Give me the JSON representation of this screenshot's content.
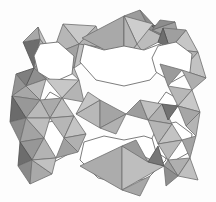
{
  "figure": {
    "kind": "crystal-structure-polyhedral-framework",
    "title": "",
    "caption": "",
    "background_color": "#fdfdfd",
    "width": 216,
    "height": 202
  },
  "palette": {
    "background": "#fdfdfd",
    "pore_white": "#ffffff",
    "face_lightest": "#d8d8d8",
    "face_light": "#c8c8c8",
    "face_mid_light": "#b9b9b9",
    "face_mid": "#ababab",
    "face_mid_dark": "#9a9a9a",
    "face_dark": "#8a8a8a",
    "face_darker": "#7a7a7a",
    "face_darkest": "#636363",
    "edge_stroke": "#6e6e6e",
    "edge_stroke_dark": "#4f4f4f"
  },
  "structure": {
    "description": "Corner-sharing tetrahedra framework projected down a channel axis",
    "motifs": [
      {
        "name": "large-pore-8-ring",
        "count": 2,
        "fill": "#ffffff"
      },
      {
        "name": "small-pore-star-ring",
        "count": 4,
        "fill": "#ffffff"
      },
      {
        "name": "bowtie-tetrahedra-pair",
        "count": 5
      },
      {
        "name": "square-4-ring-window",
        "count": 2,
        "fill": "#ffffff"
      }
    ],
    "symmetry": "2-fold / mirror about vertical and horizontal center"
  },
  "polygons": [
    {
      "id": "p001",
      "name": "tet-face",
      "points": "63,24 79,44 52,55",
      "fill": "#b6b6b6",
      "stroke": "#6e6e6e"
    },
    {
      "id": "p002",
      "name": "tet-face",
      "points": "63,24 79,44 96,26",
      "fill": "#c9c9c9",
      "stroke": "#6e6e6e"
    },
    {
      "id": "p003",
      "name": "tet-face",
      "points": "52,55 79,44 74,68",
      "fill": "#a2a2a2",
      "stroke": "#6e6e6e"
    },
    {
      "id": "p004",
      "name": "tet-face-dark",
      "points": "23,42 40,39 34,68",
      "fill": "#6d6d6d",
      "stroke": "#4f4f4f"
    },
    {
      "id": "p005",
      "name": "tet-face",
      "points": "23,42 40,39 38,27",
      "fill": "#a8a8a8",
      "stroke": "#6e6e6e"
    },
    {
      "id": "p006",
      "name": "tet-face",
      "points": "40,39 34,68 52,55",
      "fill": "#b0b0b0",
      "stroke": "#6e6e6e"
    },
    {
      "id": "p007",
      "name": "tet-face",
      "points": "38,27 40,39 52,55",
      "fill": "#c4c4c4",
      "stroke": "#6e6e6e"
    },
    {
      "id": "p008",
      "name": "tet-face",
      "points": "34,68 52,55 46,79",
      "fill": "#9e9e9e",
      "stroke": "#6e6e6e"
    },
    {
      "id": "p009",
      "name": "tet-face",
      "points": "46,79 34,68 26,86",
      "fill": "#8f8f8f",
      "stroke": "#6e6e6e"
    },
    {
      "id": "p010",
      "name": "tet-face",
      "points": "74,68 52,55 79,80",
      "fill": "#bdbdbd",
      "stroke": "#6e6e6e"
    },
    {
      "id": "p011",
      "name": "tet-face",
      "points": "96,26 79,44 104,48",
      "fill": "#b3b3b3",
      "stroke": "#6e6e6e"
    },
    {
      "id": "p012",
      "name": "tet-face",
      "points": "79,44 104,48 74,68",
      "fill": "#c1c1c1",
      "stroke": "#6e6e6e"
    },
    {
      "id": "p013",
      "name": "bowtie-left",
      "points": "82,38 124,16 124,60",
      "fill": "#a9a9a9",
      "stroke": "#6e6e6e"
    },
    {
      "id": "p014",
      "name": "bowtie-right",
      "points": "166,38 124,16 124,60",
      "fill": "#bcbcbc",
      "stroke": "#6e6e6e"
    },
    {
      "id": "p015",
      "name": "bowtie-wing",
      "points": "124,16 140,10 150,30",
      "fill": "#9c9c9c",
      "stroke": "#6e6e6e"
    },
    {
      "id": "p016",
      "name": "tet-face",
      "points": "150,30 166,38 140,10",
      "fill": "#8b8b8b",
      "stroke": "#6e6e6e"
    },
    {
      "id": "p017",
      "name": "tet-face",
      "points": "152,26 166,38 175,22",
      "fill": "#7b7b7b",
      "stroke": "#4f4f4f"
    },
    {
      "id": "p018",
      "name": "tet-face",
      "points": "137,44 124,60 150,62",
      "fill": "#bfbfbf",
      "stroke": "#6e6e6e"
    },
    {
      "id": "p019",
      "name": "tet-face",
      "points": "153,24 137,44 124,16",
      "fill": "#cdcdcd",
      "stroke": "#6e6e6e"
    },
    {
      "id": "p020",
      "name": "tet-face",
      "points": "137,44 124,16 124,60",
      "fill": "#b5b5b5",
      "stroke": "#6e6e6e"
    },
    {
      "id": "p021",
      "name": "tet-face",
      "points": "152,30 175,22 180,42",
      "fill": "#a0a0a0",
      "stroke": "#6e6e6e"
    },
    {
      "id": "p022",
      "name": "tet-face",
      "points": "160,20 152,30 175,22",
      "fill": "#8d8d8d",
      "stroke": "#6e6e6e"
    },
    {
      "id": "p023",
      "name": "tet-face",
      "points": "186,30 170,49 198,52",
      "fill": "#c6c6c6",
      "stroke": "#6e6e6e"
    },
    {
      "id": "p024",
      "name": "tet-face",
      "points": "186,30 170,49 163,28",
      "fill": "#9f9f9f",
      "stroke": "#6e6e6e"
    },
    {
      "id": "p025",
      "name": "tet-face-dark",
      "points": "158,42 170,49 163,28",
      "fill": "#6f6f6f",
      "stroke": "#4f4f4f"
    },
    {
      "id": "p026",
      "name": "tet-face",
      "points": "170,49 198,52 182,70",
      "fill": "#b2b2b2",
      "stroke": "#6e6e6e"
    },
    {
      "id": "p027",
      "name": "tet-face",
      "points": "170,49 182,70 160,64",
      "fill": "#a5a5a5",
      "stroke": "#6e6e6e"
    },
    {
      "id": "p028",
      "name": "tet-face",
      "points": "198,52 182,70 206,78",
      "fill": "#c2c2c2",
      "stroke": "#6e6e6e"
    },
    {
      "id": "p029",
      "name": "tet-face",
      "points": "182,70 206,78 192,90",
      "fill": "#aeaeae",
      "stroke": "#6e6e6e"
    },
    {
      "id": "p030",
      "name": "tet-face",
      "points": "160,64 182,70 168,86",
      "fill": "#9b9b9b",
      "stroke": "#6e6e6e"
    },
    {
      "id": "p031",
      "name": "tet-face",
      "points": "34,68 26,86 16,74",
      "fill": "#7f7f7f",
      "stroke": "#4f4f4f"
    },
    {
      "id": "p032",
      "name": "tet-face",
      "points": "26,86 16,74 12,96",
      "fill": "#949494",
      "stroke": "#6e6e6e"
    },
    {
      "id": "p033",
      "name": "tet-face",
      "points": "26,86 46,79 40,100",
      "fill": "#bababa",
      "stroke": "#6e6e6e"
    },
    {
      "id": "p034",
      "name": "tet-face",
      "points": "26,86 40,100 12,96",
      "fill": "#a7a7a7",
      "stroke": "#6e6e6e"
    },
    {
      "id": "p035",
      "name": "tet-face",
      "points": "46,79 79,80 62,98",
      "fill": "#c7c7c7",
      "stroke": "#6e6e6e"
    },
    {
      "id": "p036",
      "name": "tet-face",
      "points": "79,80 62,98 84,102",
      "fill": "#b4b4b4",
      "stroke": "#6e6e6e"
    },
    {
      "id": "p037",
      "name": "tet-face",
      "points": "40,100 62,98 50,118",
      "fill": "#aaaaaa",
      "stroke": "#6e6e6e"
    },
    {
      "id": "p038",
      "name": "tet-face",
      "points": "62,98 50,118 74,116",
      "fill": "#bebebe",
      "stroke": "#6e6e6e"
    },
    {
      "id": "p039",
      "name": "bowtie2-left",
      "points": "100,100 100,128 76,114",
      "fill": "#b8b8b8",
      "stroke": "#6e6e6e"
    },
    {
      "id": "p040",
      "name": "bowtie2-right",
      "points": "100,100 100,128 126,114",
      "fill": "#a4a4a4",
      "stroke": "#6e6e6e"
    },
    {
      "id": "p041",
      "name": "bowtie2-tail-l",
      "points": "100,100 88,92 76,114",
      "fill": "#c5c5c5",
      "stroke": "#6e6e6e"
    },
    {
      "id": "p042",
      "name": "bowtie2-tail-r",
      "points": "100,128 126,114 116,134",
      "fill": "#b1b1b1",
      "stroke": "#6e6e6e"
    },
    {
      "id": "p043",
      "name": "tet-face",
      "points": "126,114 140,100 148,120",
      "fill": "#9d9d9d",
      "stroke": "#6e6e6e"
    },
    {
      "id": "p044",
      "name": "tet-face",
      "points": "140,100 148,120 162,104",
      "fill": "#c0c0c0",
      "stroke": "#6e6e6e"
    },
    {
      "id": "p045",
      "name": "tet-face",
      "points": "148,120 162,104 172,124",
      "fill": "#abababab",
      "stroke": "#6e6e6e"
    },
    {
      "id": "p046",
      "name": "tet-face",
      "points": "168,86 192,90 178,106",
      "fill": "#b7b7b7",
      "stroke": "#6e6e6e"
    },
    {
      "id": "p047",
      "name": "tet-face",
      "points": "192,90 178,106 200,112",
      "fill": "#c8c8c8",
      "stroke": "#6e6e6e"
    },
    {
      "id": "p048",
      "name": "tet-face",
      "points": "178,106 200,112 186,126",
      "fill": "#a6a6a6",
      "stroke": "#6e6e6e"
    },
    {
      "id": "p049",
      "name": "tet-face-dark",
      "points": "162,104 178,106 168,120",
      "fill": "#727272",
      "stroke": "#4f4f4f"
    },
    {
      "id": "p050",
      "name": "tet-face",
      "points": "40,100 26,118 12,96",
      "fill": "#9898 98",
      "stroke": "#6e6e6e"
    },
    {
      "id": "p051",
      "name": "tet-face",
      "points": "50,118 26,118 40,100",
      "fill": "#b9b9b9",
      "stroke": "#6e6e6e"
    },
    {
      "id": "p052",
      "name": "tet-face-dark",
      "points": "26,118 12,96 10,122",
      "fill": "#6b6b6b",
      "stroke": "#4f4f4f"
    },
    {
      "id": "p053",
      "name": "tet-face",
      "points": "26,118 10,122 20,142",
      "fill": "#8c8c8c",
      "stroke": "#6e6e6e"
    },
    {
      "id": "p054",
      "name": "tet-face",
      "points": "26,118 20,142 44,138",
      "fill": "#a3a3a3",
      "stroke": "#6e6e6e"
    },
    {
      "id": "p055",
      "name": "tet-face",
      "points": "50,118 26,118 44,138",
      "fill": "#bdbdbd",
      "stroke": "#6e6e6e"
    },
    {
      "id": "p056",
      "name": "tet-face",
      "points": "44,138 20,142 32,160",
      "fill": "#979797",
      "stroke": "#6e6e6e"
    },
    {
      "id": "p057",
      "name": "tet-face",
      "points": "44,138 32,160 56,158",
      "fill": "#b3b3b3",
      "stroke": "#6e6e6e"
    },
    {
      "id": "p058",
      "name": "tet-face-dark",
      "points": "32,160 20,142 18,166",
      "fill": "#6d6d6d",
      "stroke": "#4f4f4f"
    },
    {
      "id": "p059",
      "name": "tet-face",
      "points": "32,160 18,166 30,184",
      "fill": "#8a8a8a",
      "stroke": "#6e6e6e"
    },
    {
      "id": "p060",
      "name": "tet-face",
      "points": "32,160 30,184 52,174",
      "fill": "#a9a9a9",
      "stroke": "#6e6e6e"
    },
    {
      "id": "p061",
      "name": "tet-face",
      "points": "56,158 32,160 52,174",
      "fill": "#c1c1c1",
      "stroke": "#6e6e6e"
    },
    {
      "id": "p062",
      "name": "tet-face",
      "points": "74,116 50,118 64,138",
      "fill": "#b6b6b6",
      "stroke": "#6e6e6e"
    },
    {
      "id": "p063",
      "name": "tet-face",
      "points": "74,116 64,138 86,134",
      "fill": "#c4c4c4",
      "stroke": "#6e6e6e"
    },
    {
      "id": "p064",
      "name": "tet-face",
      "points": "64,138 56,158 78,152",
      "fill": "#a0a0a0",
      "stroke": "#6e6e6e"
    },
    {
      "id": "p065",
      "name": "tet-face",
      "points": "86,134 64,138 78,152",
      "fill": "#b0b0b0",
      "stroke": "#6e6e6e"
    },
    {
      "id": "p066",
      "name": "bowtie3-left",
      "points": "80,166 122,146 122,190",
      "fill": "#acacac",
      "stroke": "#6e6e6e"
    },
    {
      "id": "p067",
      "name": "bowtie3-right",
      "points": "164,166 122,146 122,190",
      "fill": "#bebebe",
      "stroke": "#6e6e6e"
    },
    {
      "id": "p068",
      "name": "bowtie3-wing",
      "points": "122,146 136,140 148,162",
      "fill": "#9a9a9a",
      "stroke": "#6e6e6e"
    },
    {
      "id": "p069",
      "name": "tet-face-dark",
      "points": "148,162 164,166 158,146",
      "fill": "#777777",
      "stroke": "#4f4f4f"
    },
    {
      "id": "p070",
      "name": "tet-face",
      "points": "122,190 140,196 150,176",
      "fill": "#a7a7a7",
      "stroke": "#6e6e6e"
    },
    {
      "id": "p071",
      "name": "tet-face",
      "points": "148,120 172,124 158,144",
      "fill": "#b5b5b5",
      "stroke": "#6e6e6e"
    },
    {
      "id": "p072",
      "name": "tet-face",
      "points": "172,124 158,144 182,140",
      "fill": "#c3c3c3",
      "stroke": "#6e6e6e"
    },
    {
      "id": "p073",
      "name": "tet-face",
      "points": "186,126 200,112 196,136",
      "fill": "#b4b4b4",
      "stroke": "#6e6e6e"
    },
    {
      "id": "p074",
      "name": "tet-face",
      "points": "182,140 196,136 190,158",
      "fill": "#a4a4a4",
      "stroke": "#6e6e6e"
    },
    {
      "id": "p075",
      "name": "tet-face",
      "points": "158,144 182,140 168,160",
      "fill": "#b9b9b9",
      "stroke": "#6e6e6e"
    },
    {
      "id": "p076",
      "name": "tet-face",
      "points": "168,160 190,158 178,176",
      "fill": "#afafaf",
      "stroke": "#6e6e6e"
    },
    {
      "id": "p077",
      "name": "tet-face",
      "points": "164,166 168,160 178,176",
      "fill": "#9e9e9e",
      "stroke": "#6e6e6e"
    },
    {
      "id": "p078",
      "name": "tet-face",
      "points": "178,176 190,158 198,180",
      "fill": "#c0c0c0",
      "stroke": "#6e6e6e"
    },
    {
      "id": "p079",
      "name": "tet-face",
      "points": "164,166 178,176 166,186",
      "fill": "#8e8e8e",
      "stroke": "#6e6e6e"
    }
  ],
  "pores": [
    {
      "id": "pore-top",
      "name": "large-pore-8-ring-upper",
      "points": "84,44 104,50 124,46 144,50 160,44 166,62 150,80 124,86 96,80 80,62",
      "fill": "#ffffff"
    },
    {
      "id": "pore-bottom",
      "name": "large-pore-8-ring-lower",
      "points": "84,142 104,136 124,140 144,136 162,142 166,160 148,178 124,184 98,178 80,160",
      "fill": "#ffffff"
    },
    {
      "id": "pore-tl",
      "name": "small-pore-upper-left",
      "points": "40,44 58,42 74,56 72,74 54,82 38,72 34,56",
      "fill": "#ffffff"
    },
    {
      "id": "pore-tr",
      "name": "small-pore-upper-right",
      "points": "158,46 176,42 192,54 190,72 172,82 156,72 152,58",
      "fill": "#ffffff"
    },
    {
      "id": "pore-bl",
      "name": "small-pore-lower-left",
      "points": "40,124 58,120 74,134 72,152 54,162 38,152 34,138",
      "fill": "#ffffff"
    },
    {
      "id": "pore-br",
      "name": "small-pore-lower-right",
      "points": "158,126 176,122 192,134 190,152 172,162 156,152 152,138",
      "fill": "#ffffff"
    },
    {
      "id": "win-l",
      "name": "square-4-ring-window-left",
      "points": "50,92 64,100 54,114 40,106",
      "fill": "#ffffff"
    },
    {
      "id": "win-r",
      "name": "square-4-ring-window-right",
      "points": "166,92 180,100 170,114 156,106",
      "fill": "#ffffff"
    }
  ]
}
